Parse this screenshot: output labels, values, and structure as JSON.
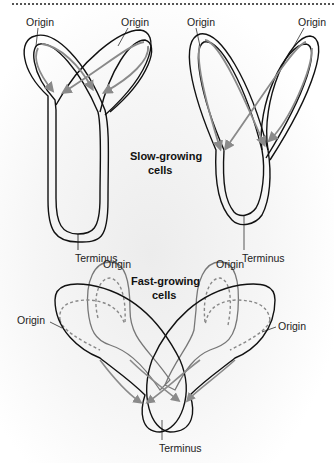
{
  "divider": {
    "style": "dotted"
  },
  "slow_growing": {
    "title_line1": "Slow-growing",
    "title_line2": "cells",
    "left": {
      "origin_left": "Origin",
      "origin_right": "Origin",
      "terminus": "Terminus"
    },
    "right": {
      "origin_left": "Origin",
      "origin_right": "Origin",
      "terminus": "Terminus"
    }
  },
  "fast_growing": {
    "title_line1": "Fast-growing",
    "title_line2": "cells",
    "origin_top_left": "Origin",
    "origin_top_right": "Origin",
    "origin_left": "Origin",
    "origin_right": "Origin",
    "terminus": "Terminus"
  },
  "colors": {
    "chromosome_outline": "#111111",
    "replication_fork_arrow": "#8a8a8a",
    "inner_loop": "#777777"
  }
}
